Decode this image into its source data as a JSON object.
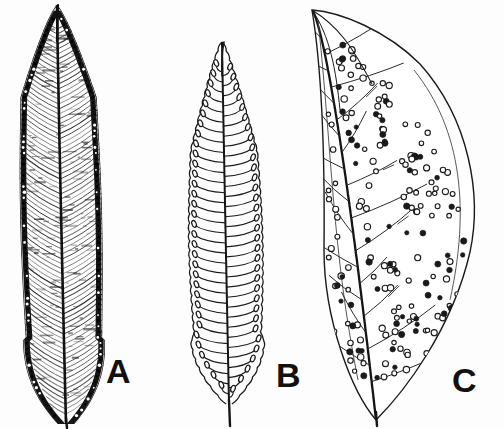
{
  "figure": {
    "domain": "botanical-illustration",
    "title": "",
    "background_color": "#fdfdfd",
    "ink_color": "#1a1a1a",
    "width": 504,
    "height": 429,
    "style": "black-and-white line drawing / stipple engraving"
  },
  "panels": [
    {
      "id": "A",
      "label": "A",
      "label_x": 106,
      "label_y": 383,
      "name": "leaf-a",
      "description": "Narrow lanceolate frond with dense continuous marginal band of sori",
      "shape": "lanceolate",
      "apex": "acuminate",
      "base": "obtuse",
      "shaded": true,
      "sorus_arrangement": "continuous marginal band",
      "geometry": {
        "apex_x": 57,
        "apex_y": 5,
        "base_x": 66,
        "base_y": 424,
        "left_edge": 28,
        "right_edge": 110,
        "widest_y": 250,
        "midrib_top_y": 40,
        "midrib_bottom_y": 420
      },
      "veins": {
        "count": 74,
        "angle_deg": 52,
        "spacing_px": 5
      }
    },
    {
      "id": "B",
      "label": "B",
      "label_x": 276,
      "label_y": 387,
      "name": "leaf-b",
      "description": "Outline frond with crenate margin and paired oval sori at vein tips",
      "shape": "oblanceolate",
      "apex": "acuminate",
      "base": "cuneate with short stipe",
      "shaded": false,
      "sorus_arrangement": "paired oval sori at vein endings near margin",
      "geometry": {
        "apex_x": 222,
        "apex_y": 42,
        "base_x": 229,
        "base_y": 426,
        "left_edge": 196,
        "right_edge": 268,
        "widest_y": 250,
        "midrib_top_y": 70,
        "midrib_bottom_y": 404,
        "stipe_bottom_y": 426
      },
      "veins": {
        "pairs": 33,
        "spacing_px": 10
      }
    },
    {
      "id": "C",
      "label": "C",
      "label_x": 452,
      "label_y": 392,
      "name": "leaf-c",
      "description": "Broad asymmetric ovate-lanceolate leaf with scattered round sori over the lamina",
      "shape": "ovate-lanceolate, falcate",
      "apex": "long-acuminate, curved",
      "base": "cuneate",
      "shaded": false,
      "sorus_arrangement": "scattered round sori across lamina, some filled",
      "geometry": {
        "apex_x": 312,
        "apex_y": 10,
        "base_x": 376,
        "base_y": 420,
        "left_edge": 322,
        "right_edge": 478,
        "widest_y": 215,
        "midrib_top_y": 14,
        "midrib_bottom_y": 418
      },
      "sori": {
        "count": 196,
        "radius_px": 2.6,
        "filled_fraction": 0.38
      },
      "secondary_veins": {
        "count": 22
      }
    }
  ],
  "labels": {
    "a": "A",
    "b": "B",
    "c": "C"
  }
}
